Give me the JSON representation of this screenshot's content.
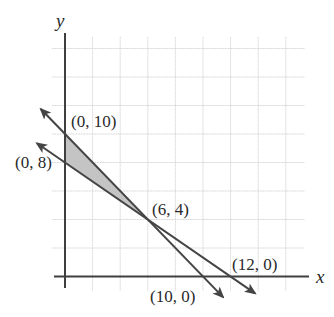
{
  "chart_data": {
    "type": "line",
    "title": "",
    "xlabel": "x",
    "ylabel": "y",
    "xlim": [
      -2.2,
      17.2
    ],
    "ylim": [
      -1.5,
      16
    ],
    "grid": true,
    "grid_step": 2,
    "grid_x": [
      2,
      4,
      6,
      8,
      10,
      12,
      14,
      16
    ],
    "grid_y": [
      2,
      4,
      6,
      8,
      10,
      12,
      14,
      16
    ],
    "series": [
      {
        "name": "line-through-(0,10)-(10,0)",
        "equation": "x + y = 10",
        "points": [
          [
            0,
            10
          ],
          [
            10,
            0
          ]
        ],
        "extent": [
          [
            -1.75,
            11.75
          ],
          [
            11.45,
            -1.45
          ]
        ],
        "arrows": "both"
      },
      {
        "name": "line-through-(0,8)-(12,0)",
        "equation": "2x + 3y = 24",
        "points": [
          [
            0,
            8
          ],
          [
            12,
            0
          ]
        ],
        "extent": [
          [
            -2.03,
            9.35
          ],
          [
            13.77,
            -1.18
          ]
        ],
        "arrows": "both"
      }
    ],
    "shaded_region": {
      "vertices": [
        [
          0,
          10
        ],
        [
          0,
          8
        ],
        [
          6,
          4
        ]
      ],
      "color": "#c4c4c4"
    },
    "annotations": [
      {
        "text": "(0, 10)",
        "point": [
          0,
          10
        ]
      },
      {
        "text": "(0, 8)",
        "point": [
          0,
          8
        ]
      },
      {
        "text": "(6, 4)",
        "point": [
          6,
          4
        ]
      },
      {
        "text": "(12, 0)",
        "point": [
          12,
          0
        ]
      },
      {
        "text": "(10, 0)",
        "point": [
          10,
          0
        ]
      }
    ]
  },
  "labels": {
    "x_axis": "x",
    "y_axis": "y",
    "p_0_10": "(0, 10)",
    "p_0_8": "(0, 8)",
    "p_6_4": "(6, 4)",
    "p_12_0": "(12, 0)",
    "p_10_0": "(10, 0)"
  },
  "colors": {
    "axis": "#3f3f3f",
    "line": "#444444",
    "grid": "#c8c8c8",
    "shade": "#c4c4c4"
  }
}
